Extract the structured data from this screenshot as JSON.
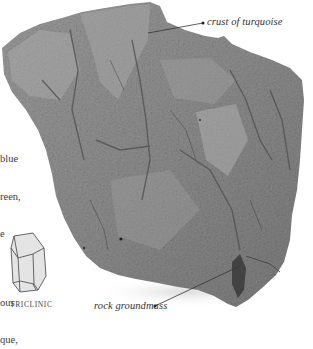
{
  "specimen": {
    "name": "turquoise on rock groundmass",
    "colors": {
      "background": "#ffffff",
      "rock_base": "#8a8a8a",
      "rock_light": "#a8a8a8",
      "rock_dark": "#5a5a5a",
      "leader_line": "#333333",
      "text": "#3a3a3a"
    }
  },
  "callouts": {
    "crust": {
      "label": "crust of turquoise"
    },
    "groundmass": {
      "label": "rock groundmass"
    }
  },
  "body_text": {
    "lines": [
      "blue",
      "reen,",
      "e",
      "",
      "ous",
      "que,"
    ]
  },
  "crystal": {
    "caption": "TRICLINIC",
    "icon": "triclinic-crystal-icon"
  }
}
